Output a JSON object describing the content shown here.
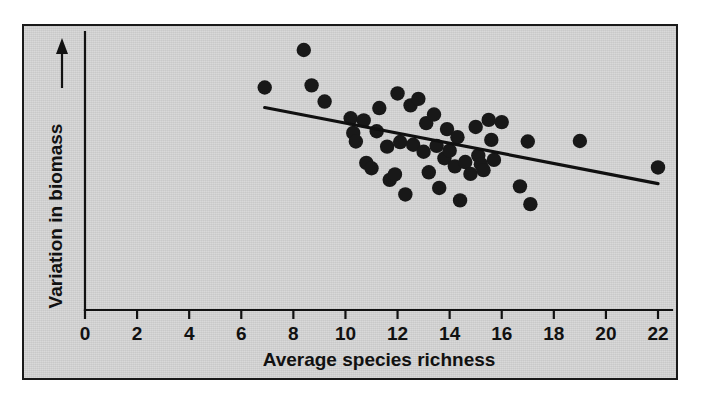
{
  "figure": {
    "background_color": "#ffffff",
    "plate_color": "#d2d2d2",
    "ink_color": "#111111",
    "point_color": "#181818"
  },
  "chart_data": {
    "type": "scatter",
    "title": "",
    "subtitle": "",
    "xlabel": "Average species richness",
    "ylabel": "Variation in biomass",
    "ylabel_arrow": "↑",
    "xlim": [
      0,
      22.6
    ],
    "ylim": [
      0,
      10
    ],
    "xticks": [
      0,
      2,
      4,
      6,
      8,
      10,
      12,
      14,
      16,
      18,
      20,
      22
    ],
    "xticklabels": [
      "0",
      "2",
      "4",
      "6",
      "8",
      "10",
      "12",
      "14",
      "16",
      "18",
      "20",
      "22"
    ],
    "yticks": [],
    "yticklabels": [],
    "grid": false,
    "legend": null,
    "y_axis_note": "unlabeled relative scale, arrow indicates increasing variation",
    "points": [
      {
        "x": 6.9,
        "y": 8.24
      },
      {
        "x": 8.4,
        "y": 9.63
      },
      {
        "x": 8.7,
        "y": 8.32
      },
      {
        "x": 9.2,
        "y": 7.72
      },
      {
        "x": 10.2,
        "y": 7.1
      },
      {
        "x": 10.3,
        "y": 6.56
      },
      {
        "x": 10.4,
        "y": 6.24
      },
      {
        "x": 10.7,
        "y": 7.02
      },
      {
        "x": 10.8,
        "y": 5.45
      },
      {
        "x": 11.0,
        "y": 5.25
      },
      {
        "x": 11.2,
        "y": 6.62
      },
      {
        "x": 11.3,
        "y": 7.48
      },
      {
        "x": 11.6,
        "y": 6.05
      },
      {
        "x": 11.7,
        "y": 4.82
      },
      {
        "x": 11.9,
        "y": 5.02
      },
      {
        "x": 12.0,
        "y": 8.02
      },
      {
        "x": 12.1,
        "y": 6.22
      },
      {
        "x": 12.3,
        "y": 4.28
      },
      {
        "x": 12.5,
        "y": 7.58
      },
      {
        "x": 12.6,
        "y": 6.12
      },
      {
        "x": 12.8,
        "y": 7.82
      },
      {
        "x": 13.0,
        "y": 5.86
      },
      {
        "x": 13.1,
        "y": 6.92
      },
      {
        "x": 13.2,
        "y": 5.1
      },
      {
        "x": 13.4,
        "y": 7.24
      },
      {
        "x": 13.5,
        "y": 6.08
      },
      {
        "x": 13.6,
        "y": 4.52
      },
      {
        "x": 13.8,
        "y": 5.62
      },
      {
        "x": 13.9,
        "y": 6.7
      },
      {
        "x": 14.0,
        "y": 5.9
      },
      {
        "x": 14.2,
        "y": 5.32
      },
      {
        "x": 14.3,
        "y": 6.4
      },
      {
        "x": 14.4,
        "y": 4.06
      },
      {
        "x": 14.6,
        "y": 5.48
      },
      {
        "x": 14.8,
        "y": 5.04
      },
      {
        "x": 15.0,
        "y": 6.78
      },
      {
        "x": 15.1,
        "y": 5.72
      },
      {
        "x": 15.2,
        "y": 5.4
      },
      {
        "x": 15.3,
        "y": 5.18
      },
      {
        "x": 15.5,
        "y": 7.04
      },
      {
        "x": 15.6,
        "y": 6.3
      },
      {
        "x": 15.7,
        "y": 5.56
      },
      {
        "x": 16.0,
        "y": 6.96
      },
      {
        "x": 16.7,
        "y": 4.58
      },
      {
        "x": 17.0,
        "y": 6.24
      },
      {
        "x": 17.1,
        "y": 3.92
      },
      {
        "x": 19.0,
        "y": 6.26
      },
      {
        "x": 22.0,
        "y": 5.28
      }
    ],
    "trend_line": {
      "style": "solid",
      "x_start": 6.9,
      "y_start": 7.5,
      "x_end": 22.0,
      "y_end": 4.68
    }
  }
}
